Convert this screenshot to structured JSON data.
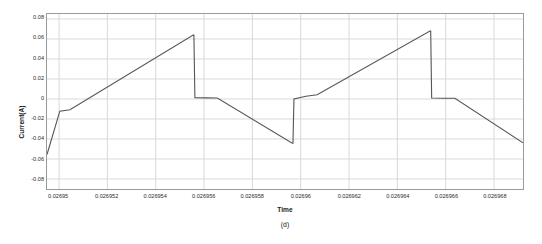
{
  "figure": {
    "caption": "(d)",
    "background_color": "#ffffff",
    "frame_color": "#9a9a9a",
    "grid_color": "#d9d9d9",
    "series_color": "#555555"
  },
  "chart_data": {
    "type": "line",
    "title": "",
    "xlabel": "Time",
    "ylabel": "Current(A)",
    "xlim": [
      0.0269495,
      0.0269692
    ],
    "ylim": [
      -0.09,
      0.085
    ],
    "grid": true,
    "legend": null,
    "xticks": [
      0.02695,
      0.026952,
      0.026954,
      0.026956,
      0.026958,
      0.02696,
      0.026962,
      0.026964,
      0.026966,
      0.026968
    ],
    "xtick_labels": [
      "0.02695",
      "0.026952",
      "0.026954",
      "0.026956",
      "0.026958",
      "0.02696",
      "0.026962",
      "0.026964",
      "0.026966",
      "0.026968"
    ],
    "yticks": [
      0.08,
      0.06,
      0.04,
      0.02,
      0,
      -0.02,
      -0.04,
      -0.06,
      -0.08
    ],
    "ytick_labels": [
      "0.08",
      "0.06",
      "0.04",
      "0.02",
      "0",
      "-0.02",
      "-0.04",
      "-0.06",
      "-0.08"
    ],
    "series": [
      {
        "name": "Current",
        "color": "#555555",
        "x": [
          0.0269495,
          0.0269495,
          0.02695003,
          0.02695045,
          0.02695555,
          0.02695558,
          0.02695562,
          0.0269561,
          0.02695655,
          0.02695965,
          0.02695968,
          0.02695972,
          0.02696022,
          0.02696068,
          0.02696535,
          0.02696538,
          0.02696542,
          0.0269659,
          0.02696638,
          0.0269692
        ],
        "y": [
          -0.0555,
          -0.0555,
          -0.0122,
          -0.0108,
          0.064,
          0.064,
          0.0013,
          0.0011,
          0.001,
          -0.0442,
          -0.0442,
          0.0,
          0.0028,
          0.0043,
          0.068,
          0.068,
          0.001,
          0.0008,
          0.0007,
          -0.0438
        ]
      }
    ],
    "annotations": [
      {
        "label": "first_peak",
        "x": 0.02695555,
        "y": 0.064
      },
      {
        "label": "first_trough",
        "x": 0.02695965,
        "y": -0.0442
      },
      {
        "label": "second_peak",
        "x": 0.02696535,
        "y": 0.068
      },
      {
        "label": "start_point",
        "x": 0.0269495,
        "y": -0.0555
      },
      {
        "label": "end_point",
        "x": 0.0269692,
        "y": -0.0438
      }
    ]
  }
}
